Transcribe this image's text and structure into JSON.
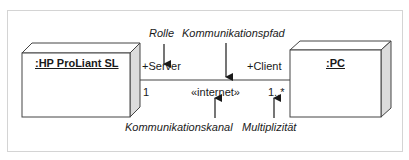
{
  "diagram": {
    "type": "UML deployment diagram",
    "nodes": [
      {
        "id": "server",
        "label": ":HP ProLiant SL"
      },
      {
        "id": "client",
        "label": ":PC"
      }
    ],
    "connection": {
      "stereotype": "«internet»",
      "left_role": "+Server",
      "right_role": "+Client",
      "left_multiplicity": "1",
      "right_multiplicity": "1..*"
    },
    "annotations": {
      "role": "Rolle",
      "communication_path": "Kommunikationspfad",
      "communication_channel": "Kommunikationskanal",
      "multiplicity": "Multiplizität"
    },
    "colors": {
      "line": "#333333",
      "node_fill": "#ffffff",
      "node_side": "#dcdcdc",
      "frame": "#d4d4d4"
    }
  }
}
